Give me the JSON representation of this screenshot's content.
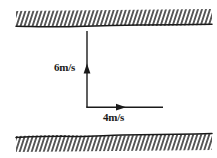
{
  "figure": {
    "type": "physics-vector-diagram",
    "background_color": "#ffffff",
    "line_color": "#1a1a1a",
    "hatch_color": "#2b2b2b"
  },
  "boundaries": {
    "top": {
      "name": "top-bank",
      "hatch_side": "above",
      "hatch_direction": "backslash",
      "line_y": 26,
      "band_height": 15,
      "x_start": 16,
      "x_end": 212
    },
    "bottom": {
      "name": "bottom-bank",
      "hatch_side": "below",
      "hatch_direction": "backslash",
      "line_y": 136,
      "band_height": 16,
      "x_start": 16,
      "x_end": 212
    }
  },
  "vectors": [
    {
      "name": "vertical-velocity-vector",
      "label": "6m/s",
      "magnitude": 6,
      "unit": "m/s",
      "direction": "up",
      "tail": {
        "x": 87,
        "y": 107
      },
      "head": {
        "x": 87,
        "y": 31
      },
      "arrowhead": {
        "x": 87,
        "y": 69
      }
    },
    {
      "name": "horizontal-velocity-vector",
      "label": "4m/s",
      "magnitude": 4,
      "unit": "m/s",
      "direction": "right",
      "tail": {
        "x": 87,
        "y": 107
      },
      "head": {
        "x": 163,
        "y": 107
      },
      "arrowhead": {
        "x": 122,
        "y": 107
      }
    }
  ],
  "labels": {
    "vertical": "6m/s",
    "horizontal": "4m/s"
  }
}
